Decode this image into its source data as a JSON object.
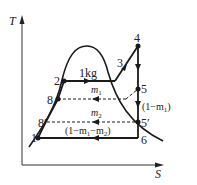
{
  "diagram": {
    "type": "T-S diagram (regenerative Rankine cycle with two extractions)",
    "axes": {
      "y_label": "T",
      "x_label": "S"
    },
    "points": [
      {
        "id": "1",
        "label": "1"
      },
      {
        "id": "2",
        "label": "2"
      },
      {
        "id": "3",
        "label": "3"
      },
      {
        "id": "4",
        "label": "4"
      },
      {
        "id": "5",
        "label": "5"
      },
      {
        "id": "5p",
        "label": "5′"
      },
      {
        "id": "6",
        "label": "6"
      },
      {
        "id": "8",
        "label": "8"
      },
      {
        "id": "8p",
        "label": "8′"
      }
    ],
    "annotations": {
      "mass_total": "1kg",
      "m1": "m",
      "m1_sub": "1",
      "m2": "m",
      "m2_sub": "2",
      "after_first": "(1−m",
      "after_first_sub": "1",
      "after_first_close": ")",
      "after_second_a": "(1−m",
      "after_second_sub1": "1",
      "after_second_b": "−m",
      "after_second_sub2": "2",
      "after_second_close": ")"
    },
    "colors": {
      "line": "#1a1a1a",
      "background": "#ffffff"
    }
  }
}
